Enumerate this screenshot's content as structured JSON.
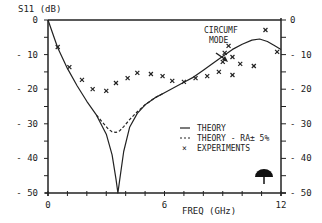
{
  "chart_data": {
    "type": "line",
    "title": "",
    "ylabel": "S11 (dB)",
    "xlabel": "FREQ (GHz)",
    "xlim": [
      0,
      12
    ],
    "ylim": [
      -50,
      0
    ],
    "x_ticks": [
      0,
      6,
      12
    ],
    "x_tick_labels": [
      "0",
      "6",
      "12"
    ],
    "y_ticks": [
      0,
      -10,
      -20,
      -30,
      -40,
      -50
    ],
    "y_tick_labels_left": [
      "0",
      "- 10",
      "- 20",
      "- 30",
      "- 40",
      "- 50"
    ],
    "y_tick_labels_right": [
      "0",
      "- 10",
      "- 20",
      "- 30",
      "- 40",
      "- 50"
    ],
    "grid": false,
    "legend_position": "lower-right inside",
    "annotations": [
      {
        "text_line1": "CIRCUMF",
        "text_line2": "MODE",
        "points_to_x": 9.1,
        "points_to_y": -8.5
      }
    ],
    "series": [
      {
        "name": "THEORY",
        "style": "solid",
        "x": [
          0,
          0.5,
          1.0,
          1.5,
          2.0,
          2.5,
          3.0,
          3.3,
          3.5,
          3.6,
          3.7,
          3.9,
          4.2,
          4.6,
          5.0,
          5.5,
          6.0,
          6.5,
          7.0,
          7.5,
          8.0,
          8.5,
          9.0,
          9.5,
          10.0,
          10.5,
          10.9,
          11.3,
          11.7,
          12.0
        ],
        "y": [
          0,
          -8,
          -14,
          -19,
          -23.5,
          -27.5,
          -33,
          -39,
          -46,
          -50,
          -46,
          -38,
          -31,
          -27,
          -24.5,
          -22.5,
          -21,
          -19.5,
          -18,
          -16.5,
          -14.5,
          -12.5,
          -10.5,
          -8.5,
          -7,
          -5.8,
          -5.5,
          -6.2,
          -7.5,
          -8.5
        ]
      },
      {
        "name": "THEORY - RA± 5%",
        "style": "dashed",
        "x": [
          2.5,
          2.8,
          3.1,
          3.3,
          3.5,
          3.7,
          3.9,
          4.2,
          4.6,
          5.0,
          5.5,
          6.0
        ],
        "y": [
          -27.5,
          -29.5,
          -31.5,
          -32.3,
          -32.5,
          -32,
          -30.8,
          -28.8,
          -26.5,
          -24.5,
          -22.5,
          -21
        ]
      },
      {
        "name": "EXPERIMENTS",
        "style": "markers-x",
        "x": [
          0.5,
          1.1,
          1.75,
          2.3,
          3.0,
          3.5,
          4.1,
          4.6,
          5.3,
          5.9,
          6.4,
          7.0,
          7.6,
          8.2,
          8.8,
          9.0,
          9.1,
          9.3,
          9.5,
          9.9,
          9.5,
          10.6,
          11.2,
          11.8
        ],
        "y": [
          -7.8,
          -13.6,
          -17.3,
          -20,
          -20.5,
          -18.2,
          -16.8,
          -15.3,
          -15.6,
          -16.2,
          -17.6,
          -17.9,
          -16.8,
          -16.2,
          -15,
          -12.1,
          -9.5,
          -7.5,
          -10.7,
          -12.7,
          -15.9,
          -13.3,
          -2.9,
          -9.2
        ]
      }
    ]
  },
  "legend": {
    "items": [
      {
        "symbol": "—",
        "label": "THEORY"
      },
      {
        "symbol": "---",
        "label": "THEORY - RA± 5%"
      },
      {
        "symbol": "×",
        "label": "EXPERIMENTS"
      }
    ]
  },
  "annotation": {
    "line1": "CIRCUMF",
    "line2": "MODE"
  },
  "icon": {
    "name": "antenna-dome-icon"
  }
}
